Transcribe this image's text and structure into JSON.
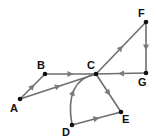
{
  "diagram": {
    "type": "directed-graph",
    "nodes": [
      {
        "id": "A",
        "label": "A",
        "x": 20,
        "y": 99,
        "lx": 10,
        "ly": 103
      },
      {
        "id": "B",
        "label": "B",
        "x": 45,
        "y": 74,
        "lx": 37,
        "ly": 60
      },
      {
        "id": "C",
        "label": "C",
        "x": 96,
        "y": 74,
        "lx": 87,
        "ly": 60
      },
      {
        "id": "D",
        "label": "D",
        "x": 72,
        "y": 125,
        "lx": 62,
        "ly": 127
      },
      {
        "id": "E",
        "label": "E",
        "x": 121,
        "y": 112,
        "lx": 122,
        "ly": 114
      },
      {
        "id": "F",
        "label": "F",
        "x": 146,
        "y": 22,
        "lx": 138,
        "ly": 8
      },
      {
        "id": "G",
        "label": "G",
        "x": 146,
        "y": 73,
        "lx": 138,
        "ly": 77
      }
    ],
    "edges": [
      {
        "from": "A",
        "to": "B",
        "curved": false
      },
      {
        "from": "A",
        "to": "C",
        "curved": false
      },
      {
        "from": "B",
        "to": "C",
        "curved": false
      },
      {
        "from": "D",
        "to": "C",
        "curved": true
      },
      {
        "from": "D",
        "to": "E",
        "curved": false
      },
      {
        "from": "C",
        "to": "E",
        "curved": false
      },
      {
        "from": "C",
        "to": "F",
        "curved": false
      },
      {
        "from": "F",
        "to": "G",
        "curved": false
      },
      {
        "from": "G",
        "to": "C",
        "curved": false
      }
    ],
    "colors": {
      "edge": "#6e6e6e",
      "arrow": "#7a7a7a",
      "node": "#111111",
      "label": "#111111"
    }
  }
}
